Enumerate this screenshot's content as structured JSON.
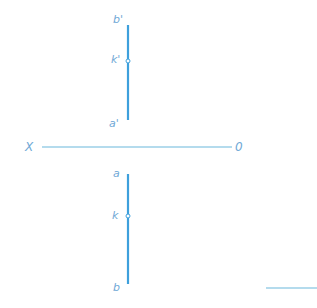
{
  "diagram": {
    "type": "orthographic-projection",
    "colors": {
      "line": "#3ea0dc",
      "axis": "#6ab8dc",
      "label": "#6fa8d6",
      "point_fill": "#ffffff"
    },
    "axis": {
      "left_label": "X",
      "right_label": "0",
      "x1": 42,
      "x2": 232,
      "y": 147
    },
    "front_view": {
      "line": {
        "x": 128,
        "y1": 25,
        "y2": 120
      },
      "point": {
        "x": 128,
        "y": 61
      },
      "labels": {
        "top": "b'",
        "middle": "k'",
        "bottom": "a'"
      }
    },
    "top_view": {
      "line": {
        "x": 128,
        "y1": 174,
        "y2": 284
      },
      "point": {
        "x": 128,
        "y": 216
      },
      "labels": {
        "top": "a",
        "middle": "k",
        "bottom": "b"
      }
    },
    "fragment_line": {
      "x1": 266,
      "x2": 317,
      "y": 288
    }
  }
}
